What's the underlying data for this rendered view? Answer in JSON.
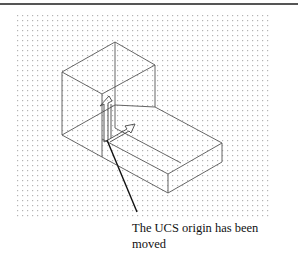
{
  "figure": {
    "type": "autocad-isometric-drawing",
    "grid": {
      "x": 17,
      "y": 15,
      "width": 255,
      "height": 205,
      "dot_color": "#b0b0b0",
      "spacing": 5
    },
    "line_color": "#555555",
    "leader_color": "#111111"
  },
  "annotation": {
    "line1": "The UCS origin has been",
    "line2": "moved"
  },
  "icons": {
    "ucs": "ucs-icon"
  }
}
